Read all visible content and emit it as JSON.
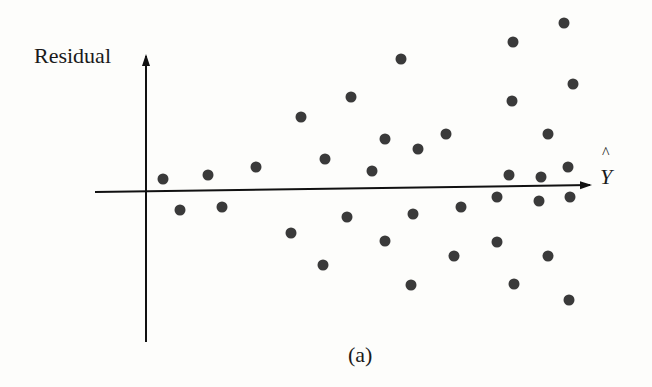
{
  "chart_data": {
    "type": "scatter",
    "title": "",
    "caption": "(a)",
    "ylabel": "Residual",
    "xlabel": "Y",
    "xlabel_hat": "^",
    "grid": false,
    "legend": null,
    "axis_origin_px": [
      146,
      191
    ],
    "points_px": [
      [
        163,
        179
      ],
      [
        208,
        175
      ],
      [
        256,
        167
      ],
      [
        180,
        210
      ],
      [
        222,
        207
      ],
      [
        301,
        117
      ],
      [
        351,
        97
      ],
      [
        401,
        59
      ],
      [
        325,
        159
      ],
      [
        372,
        171
      ],
      [
        385,
        139
      ],
      [
        418,
        149
      ],
      [
        446,
        134
      ],
      [
        291,
        233
      ],
      [
        347,
        217
      ],
      [
        323,
        265
      ],
      [
        385,
        241
      ],
      [
        413,
        214
      ],
      [
        411,
        285
      ],
      [
        461,
        207
      ],
      [
        454,
        256
      ],
      [
        497,
        197
      ],
      [
        497,
        242
      ],
      [
        513,
        42
      ],
      [
        512,
        101
      ],
      [
        509,
        175
      ],
      [
        514,
        284
      ],
      [
        564,
        23
      ],
      [
        573,
        84
      ],
      [
        548,
        134
      ],
      [
        541,
        177
      ],
      [
        568,
        167
      ],
      [
        539,
        201
      ],
      [
        570,
        197
      ],
      [
        548,
        256
      ],
      [
        569,
        300
      ]
    ],
    "colors": {
      "points": "#3a3a3a",
      "axes": "#111111"
    }
  },
  "labels": {
    "ylabel": "Residual",
    "xlabel": "Y",
    "hat": "^",
    "caption": "(a)"
  }
}
